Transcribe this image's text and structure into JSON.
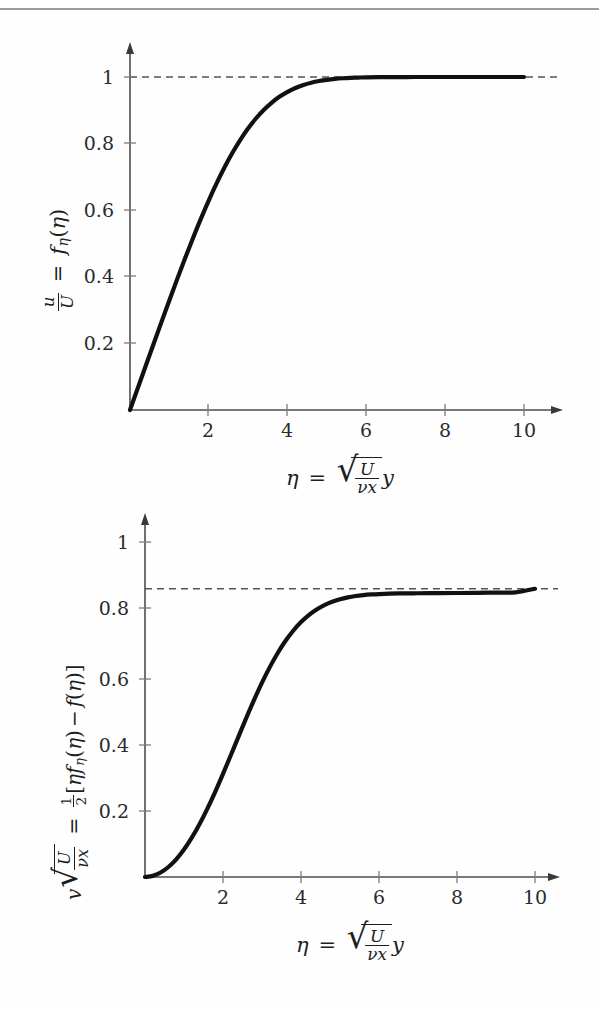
{
  "page": {
    "background": "#fefefe",
    "rule_color": "#9a9a9a",
    "curve_color": "#111111",
    "axis_color": "#4d4d4d",
    "asymptote_color": "#555555"
  },
  "charts": [
    {
      "id": "velocity-profile-u",
      "y_ticks": [
        "0.2",
        "0.4",
        "0.6",
        "0.8",
        "1"
      ],
      "x_ticks": [
        "2",
        "4",
        "6",
        "8",
        "10"
      ],
      "ylabel": {
        "lhs_num": "u",
        "lhs_den": "U",
        "eq": "=",
        "fn": "f",
        "fn_sub": "η",
        "arg": "η"
      },
      "xlabel": {
        "eta": "η",
        "eq": "=",
        "num": "U",
        "den_nu": "ν",
        "den_x": "x",
        "y": "y"
      }
    },
    {
      "id": "velocity-profile-v",
      "y_ticks": [
        "0.2",
        "0.4",
        "0.6",
        "0.8",
        "1"
      ],
      "x_ticks": [
        "2",
        "4",
        "6",
        "8",
        "10"
      ],
      "ylabel": {
        "v": "v",
        "num": "U",
        "den_nu": "ν",
        "den_x": "x",
        "eq": "=",
        "half_num": "1",
        "half_den": "2",
        "open": "[",
        "eta": "η",
        "fn": "f",
        "fn_sub": "η",
        "arg1": "η",
        "minus": "−",
        "fn2": "f",
        "arg2": "η",
        "close": "]"
      },
      "xlabel": {
        "eta": "η",
        "eq": "=",
        "num": "U",
        "den_nu": "ν",
        "den_x": "x",
        "y": "y"
      }
    }
  ],
  "chart_data": [
    {
      "type": "line",
      "id": "blasius-f-prime",
      "title": "",
      "xlabel": "eta = sqrt(U/(nu*x)) y",
      "ylabel": "u/U = f_eta(eta)",
      "xlim": [
        0,
        11
      ],
      "ylim": [
        0,
        1.07
      ],
      "xticks": [
        2,
        4,
        6,
        8,
        10
      ],
      "yticks": [
        0.2,
        0.4,
        0.6,
        0.8,
        1
      ],
      "grid": false,
      "legend": "none",
      "annotations": [
        {
          "kind": "dashed-horizontal-asymptote",
          "value": 1.0,
          "from_x": 0,
          "to_x": 11
        }
      ],
      "series": [
        {
          "name": "u/U = f'(eta)",
          "x": [
            0,
            0.2,
            0.4,
            0.6,
            0.8,
            1.0,
            1.2,
            1.4,
            1.6,
            1.8,
            2.0,
            2.2,
            2.4,
            2.6,
            2.8,
            3.0,
            3.2,
            3.4,
            3.6,
            3.8,
            4.0,
            4.2,
            4.4,
            4.6,
            4.8,
            5.0,
            5.2,
            5.4,
            5.6,
            5.8,
            6.0,
            6.5,
            7.0,
            7.5,
            8.0,
            8.5,
            9.0,
            9.5,
            10.0
          ],
          "values": [
            0.0,
            0.0664,
            0.1328,
            0.1989,
            0.2647,
            0.3298,
            0.3938,
            0.4563,
            0.5168,
            0.5748,
            0.6298,
            0.6813,
            0.729,
            0.7725,
            0.8115,
            0.8461,
            0.8761,
            0.9018,
            0.9233,
            0.9411,
            0.9555,
            0.967,
            0.9759,
            0.9827,
            0.9878,
            0.9916,
            0.9943,
            0.9962,
            0.9975,
            0.9984,
            0.999,
            0.9997,
            0.9999,
            1.0,
            1.0,
            1.0,
            1.0,
            1.0,
            1.0
          ]
        }
      ]
    },
    {
      "type": "line",
      "id": "blasius-v-similarity",
      "title": "",
      "xlabel": "eta = sqrt(U/(nu*x)) y",
      "ylabel": "v sqrt(U/(nu x)) = 1/2 [eta f_eta(eta) - f(eta)]",
      "xlim": [
        0,
        11
      ],
      "ylim": [
        0,
        1.07
      ],
      "xticks": [
        2,
        4,
        6,
        8,
        10
      ],
      "yticks": [
        0.2,
        0.4,
        0.6,
        0.8,
        1
      ],
      "grid": false,
      "legend": "none",
      "annotations": [
        {
          "kind": "dashed-horizontal-asymptote",
          "value": 0.8604,
          "from_x": 0,
          "to_x": 11
        }
      ],
      "series": [
        {
          "name": "0.5*(eta*f' - f)",
          "x": [
            0,
            0.2,
            0.4,
            0.6,
            0.8,
            1.0,
            1.2,
            1.4,
            1.6,
            1.8,
            2.0,
            2.2,
            2.4,
            2.6,
            2.8,
            3.0,
            3.2,
            3.4,
            3.6,
            3.8,
            4.0,
            4.2,
            4.4,
            4.6,
            4.8,
            5.0,
            5.2,
            5.4,
            5.6,
            5.8,
            6.0,
            6.5,
            7.0,
            7.5,
            8.0,
            8.5,
            9.0,
            9.5,
            10.0
          ],
          "values": [
            0.0,
            0.0033,
            0.0133,
            0.0298,
            0.0528,
            0.0821,
            0.1174,
            0.1583,
            0.2042,
            0.2544,
            0.3079,
            0.3635,
            0.4199,
            0.4757,
            0.5294,
            0.5801,
            0.6265,
            0.668,
            0.7043,
            0.7352,
            0.761,
            0.782,
            0.7987,
            0.8118,
            0.8218,
            0.8293,
            0.8348,
            0.8388,
            0.8415,
            0.8434,
            0.8447,
            0.8464,
            0.847,
            0.8473,
            0.8477,
            0.8482,
            0.849,
            0.8497,
            0.8604
          ]
        }
      ]
    }
  ]
}
